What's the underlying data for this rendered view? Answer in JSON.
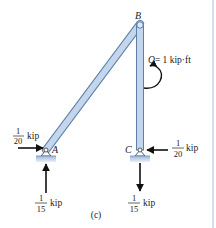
{
  "figure": {
    "caption": "(c)",
    "colors": {
      "member_fill": "#b9cde6",
      "member_stroke": "#5d7fa8",
      "support_fill": "#a9c2df",
      "arrow": "#111111",
      "border": "#b8c8e0"
    },
    "nodes": {
      "A": {
        "label": "A"
      },
      "B": {
        "label": "B"
      },
      "C": {
        "label": "C"
      }
    },
    "moment": {
      "symbol": "Q",
      "text": "Q = 1 kip·ft",
      "value": "= 1 kip·ft",
      "direction": "clockwise"
    },
    "reactions": [
      {
        "node": "A",
        "direction": "right",
        "numerator": "1",
        "denominator": "20",
        "unit": "kip"
      },
      {
        "node": "A",
        "direction": "up",
        "numerator": "1",
        "denominator": "15",
        "unit": "kip"
      },
      {
        "node": "C",
        "direction": "left",
        "numerator": "1",
        "denominator": "20",
        "unit": "kip"
      },
      {
        "node": "C",
        "direction": "down",
        "numerator": "1",
        "denominator": "15",
        "unit": "kip"
      }
    ]
  }
}
